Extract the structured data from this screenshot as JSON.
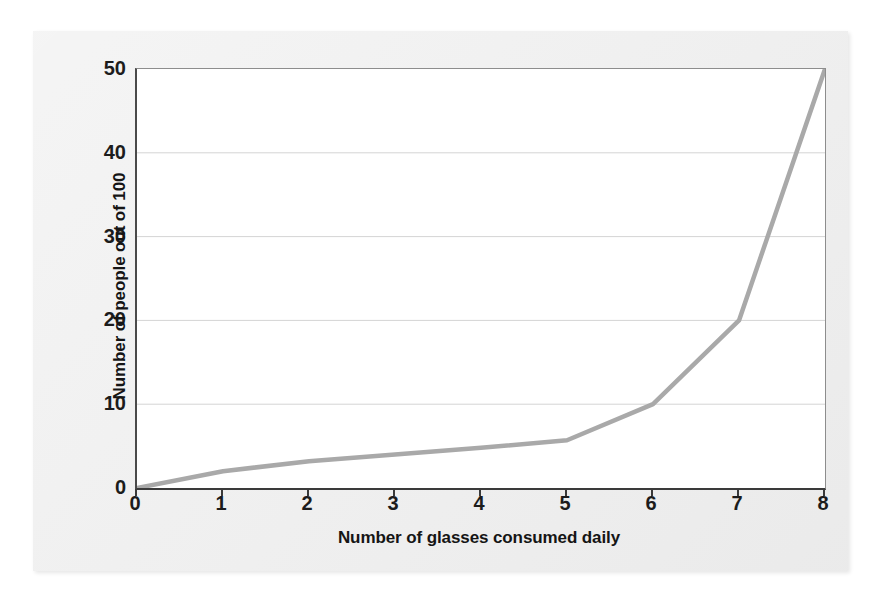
{
  "chart_data": {
    "type": "line",
    "title": "",
    "xlabel": "Number of glasses consumed daily",
    "ylabel": "Number of people out of 100",
    "x": [
      0,
      1,
      2,
      3,
      4,
      5,
      6,
      7,
      8
    ],
    "values": [
      0,
      2,
      3.2,
      4,
      4.8,
      5.7,
      10,
      20,
      50
    ],
    "series": [
      {
        "name": "People out of 100",
        "values": [
          0,
          2,
          3.2,
          4,
          4.8,
          5.7,
          10,
          20,
          50
        ]
      }
    ],
    "xlim": [
      0,
      8
    ],
    "ylim": [
      0,
      50
    ],
    "xticks": [
      "0",
      "1",
      "2",
      "3",
      "4",
      "5",
      "6",
      "7",
      "8"
    ],
    "yticks": [
      "0",
      "10",
      "20",
      "30",
      "40",
      "50"
    ],
    "xtick_values": [
      0,
      1,
      2,
      3,
      4,
      5,
      6,
      7,
      8
    ],
    "ytick_values": [
      0,
      10,
      20,
      30,
      40,
      50
    ],
    "grid": "horizontal",
    "legend": "none",
    "line_color": "#a9a9a9",
    "line_width": 4.5,
    "plot_background": "#ffffff",
    "card_background": "#ececec",
    "axis_color": "#3a3a3a",
    "grid_color": "#d4d4d4",
    "text_color": "#1c1c1c"
  }
}
